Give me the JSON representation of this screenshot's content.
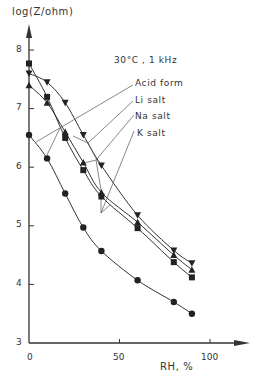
{
  "chart_data": {
    "type": "line",
    "xlabel": "RH, %",
    "ylabel": "log(Z/ohm)",
    "xlim": [
      0,
      120
    ],
    "ylim": [
      3,
      8.5
    ],
    "xticks": [
      0,
      50,
      100
    ],
    "yticks": [
      3,
      4,
      5,
      6,
      7,
      8
    ],
    "grid": false,
    "legend_position": "annotated leader lines, upper right",
    "series": [
      {
        "name": "Acid form",
        "marker": "circle",
        "x": [
          0,
          10,
          20,
          30,
          40,
          60,
          80,
          90
        ],
        "y": [
          6.55,
          6.15,
          5.55,
          4.97,
          4.57,
          4.07,
          3.7,
          3.5
        ]
      },
      {
        "name": "Li salt",
        "marker": "triangle-down",
        "x": [
          0,
          10,
          20,
          30,
          40,
          60,
          80,
          90
        ],
        "y": [
          7.6,
          7.45,
          7.1,
          6.55,
          6.03,
          5.18,
          4.58,
          4.36
        ]
      },
      {
        "name": "Na salt",
        "marker": "triangle-up",
        "x": [
          0,
          10,
          20,
          30,
          40,
          60,
          80,
          90
        ],
        "y": [
          7.4,
          7.1,
          6.6,
          6.08,
          5.57,
          5.06,
          4.5,
          4.25
        ]
      },
      {
        "name": "K salt",
        "marker": "square",
        "x": [
          0,
          10,
          20,
          30,
          40,
          60,
          80,
          90
        ],
        "y": [
          7.77,
          7.2,
          6.5,
          5.95,
          5.5,
          4.96,
          4.38,
          4.12
        ]
      }
    ]
  },
  "labels": {
    "ylabel": "log(Z/ohm)",
    "xlabel": "RH,  %",
    "condition": "30°C ,   1 kHz",
    "acid": "Acid  form",
    "li": "Li  salt",
    "na": "Na  salt",
    "k": "K  salt",
    "x0": "0",
    "x50": "50",
    "x100": "100",
    "y3": "3",
    "y4": "4",
    "y5": "5",
    "y6": "6",
    "y7": "7",
    "y8": "8"
  }
}
